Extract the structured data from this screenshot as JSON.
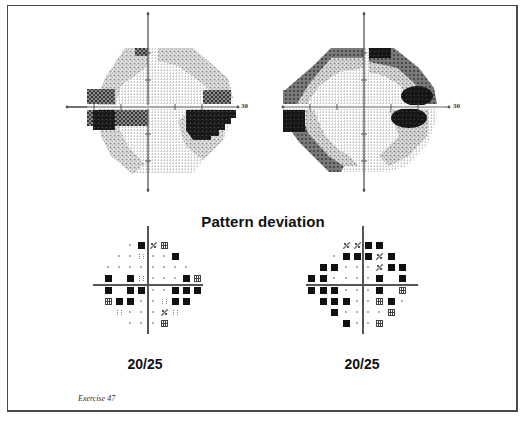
{
  "figure": {
    "caption": "Exercise 47",
    "section_title": "Pattern deviation"
  },
  "grayscale_plots": [
    {
      "eye": "left-panel",
      "axis_label": "30",
      "center": [
        148,
        101
      ],
      "defects": [
        {
          "desc": "superior nasal-step edge",
          "level": "mid"
        },
        {
          "desc": "nasal defect above horizontal meridian (left side)",
          "level": "dark"
        },
        {
          "desc": "nasal defect below horizontal meridian (left side)",
          "level": "black"
        },
        {
          "desc": "temporal defect above meridian (right side)",
          "level": "mid"
        },
        {
          "desc": "temporal defect below meridian (right side)",
          "level": "black"
        }
      ]
    },
    {
      "eye": "right-panel",
      "axis_label": "30",
      "center": [
        364,
        101
      ],
      "defects": [
        {
          "desc": "superior arcuate band",
          "level": "mid"
        },
        {
          "desc": "nasal step left edge",
          "level": "dark"
        },
        {
          "desc": "inferior arcuate band (left)",
          "level": "dark"
        },
        {
          "desc": "paracentral dense defect above meridian (right)",
          "level": "black"
        },
        {
          "desc": "paracentral dense defect below meridian (right)",
          "level": "black"
        }
      ]
    }
  ],
  "chart_data": [
    {
      "type": "table",
      "title": "Pattern deviation (left panel)",
      "legend": {
        "B": "black square (p<0.5%)",
        "H": "dense hatch (p<1%)",
        "M": "medium checker (p<2%)",
        "L": "light stipple (p<5%)",
        "D": "dot (normal)",
        "": "no test point"
      },
      "column_x": [
        108,
        119,
        130,
        141,
        153,
        164,
        175,
        186,
        197
      ],
      "row_y": [
        245,
        256,
        267,
        278,
        290,
        301,
        312,
        323
      ],
      "grid": [
        [
          "",
          "",
          "D",
          "B",
          "M",
          "H",
          "",
          "",
          ""
        ],
        [
          "",
          "D",
          "D",
          "L",
          "D",
          "D",
          "B",
          "",
          ""
        ],
        [
          "D",
          "D",
          "D",
          "D",
          "D",
          "D",
          "D",
          "D",
          ""
        ],
        [
          "B",
          "",
          "B",
          "L",
          "D",
          "D",
          "D",
          "B",
          "H"
        ],
        [
          "B",
          "",
          "B",
          "B",
          "D",
          "D",
          "B",
          "B",
          "B"
        ],
        [
          "H",
          "B",
          "B",
          "D",
          "D",
          "L",
          "B",
          "B",
          ""
        ],
        [
          "",
          "L",
          "D",
          "D",
          "D",
          "M",
          "L",
          "",
          ""
        ],
        [
          "",
          "",
          "D",
          "D",
          "D",
          "H",
          "",
          "",
          ""
        ]
      ],
      "visual_acuity": "20/25"
    },
    {
      "type": "table",
      "title": "Pattern deviation (right panel)",
      "legend": {
        "B": "black square (p<0.5%)",
        "H": "dense hatch (p<1%)",
        "M": "medium checker (p<2%)",
        "L": "light stipple (p<5%)",
        "D": "dot (normal)",
        "": "no test point"
      },
      "column_x": [
        311,
        323,
        334,
        346,
        357,
        368,
        379,
        391,
        402
      ],
      "row_y": [
        245,
        256,
        267,
        278,
        290,
        301,
        312,
        323
      ],
      "grid": [
        [
          "",
          "",
          "",
          "M",
          "M",
          "B",
          "B",
          "",
          ""
        ],
        [
          "",
          "",
          "D",
          "B",
          "B",
          "B",
          "M",
          "B",
          ""
        ],
        [
          "",
          "B",
          "B",
          "D",
          "D",
          "D",
          "M",
          "B",
          "B"
        ],
        [
          "B",
          "B",
          "D",
          "D",
          "D",
          "D",
          "B",
          "",
          "B"
        ],
        [
          "B",
          "B",
          "B",
          "D",
          "D",
          "D",
          "B",
          "",
          "H"
        ],
        [
          "",
          "B",
          "B",
          "B",
          "D",
          "D",
          "H",
          "B",
          "D"
        ],
        [
          "",
          "",
          "B",
          "D",
          "D",
          "D",
          "D",
          "H",
          ""
        ],
        [
          "",
          "",
          "",
          "B",
          "D",
          "D",
          "H",
          "",
          ""
        ]
      ],
      "visual_acuity": "20/25"
    }
  ],
  "pattern_deviation": {
    "left": {
      "acuity": "20/25",
      "axis_x": 148,
      "axis_y": 285
    },
    "right": {
      "acuity": "20/25",
      "axis_x": 363,
      "axis_y": 285
    }
  },
  "colors": {
    "frame": "#4a4a4a",
    "axis": "#555555",
    "defect_black": "#111111",
    "defect_dark": "#3a3a3a",
    "defect_mid": "#6e6e6e",
    "defect_light": "#b8b8b8"
  }
}
